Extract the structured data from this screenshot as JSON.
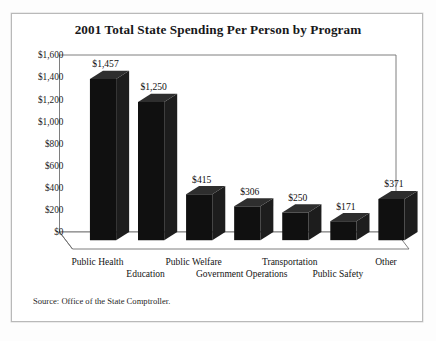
{
  "figure": {
    "title": "2001 Total State Spending Per Person by Program",
    "source_note": "Source: Office of the State Comptroller."
  },
  "chart_data": {
    "type": "bar",
    "title": "2001 Total State Spending Per Person by Program",
    "xlabel": "",
    "ylabel": "",
    "ylim": [
      0,
      1600
    ],
    "ytick_step": 200,
    "grid": false,
    "legend": null,
    "style": "3d-column",
    "currency_prefix": "$",
    "categories": [
      "Public Health",
      "Education",
      "Public Welfare",
      "Government Operations",
      "Transportation",
      "Public Safety",
      "Other"
    ],
    "values": [
      1457,
      1250,
      415,
      306,
      250,
      171,
      371
    ],
    "data_labels": [
      "$1,457",
      "$1,250",
      "$415",
      "$306",
      "$250",
      "$171",
      "$371"
    ],
    "ytick_labels": [
      "$1,600",
      "$1,400",
      "$1,200",
      "$1,000",
      "$800",
      "$600",
      "$400",
      "$200",
      "$0"
    ],
    "ytick_values": [
      1600,
      1400,
      1200,
      1000,
      800,
      600,
      400,
      200,
      0
    ]
  },
  "colors": {
    "bar": "#101010",
    "bar_top": "#2e2e2e",
    "bar_side": "#1d1d1d",
    "axis": "#6f6f6f",
    "text": "#141414",
    "frame": "#b9b9b9",
    "background": "#ffffff"
  }
}
